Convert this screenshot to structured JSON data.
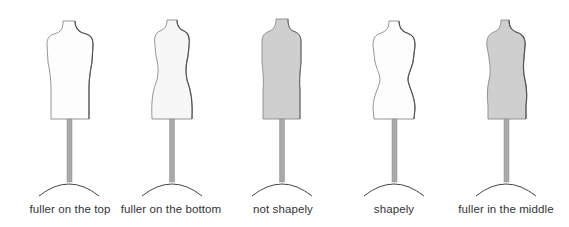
{
  "figure": {
    "colors": {
      "outline": "#8a8a8a",
      "shadow": "#555555",
      "fill_light": "#fdfdfd",
      "fill_gray": "#cfcfcf",
      "pole": "#a9a9a9",
      "pole_edge": "#8f8f8f",
      "base": "#444444",
      "label": "#333333"
    },
    "mannequins": [
      {
        "id": "fuller-on-top",
        "label": "fuller on the top",
        "fill": "light"
      },
      {
        "id": "fuller-on-bottom",
        "label": "fuller on the bottom",
        "fill": "light"
      },
      {
        "id": "not-shapely",
        "label": "not shapely",
        "fill": "gray"
      },
      {
        "id": "shapely",
        "label": "shapely",
        "fill": "light"
      },
      {
        "id": "fuller-in-middle",
        "label": "fuller in the middle",
        "fill": "gray"
      }
    ]
  }
}
